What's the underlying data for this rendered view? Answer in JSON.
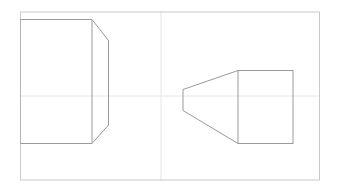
{
  "canvas": {
    "width": 341,
    "height": 193,
    "background_color": "#ffffff"
  },
  "frame": {
    "label": "drawing-frame",
    "x": 20,
    "y": 11.5,
    "width": 300,
    "height": 169,
    "stroke_color": "#c9c9c9",
    "stroke_width": 1
  },
  "guides": {
    "stroke_color": "#e8e6e4",
    "stroke_width": 1,
    "vertical": {
      "label": "vertical-center-guide",
      "x": 161,
      "y1": 11.5,
      "y2": 180.5
    },
    "horizontal": {
      "label": "horizontal-center-guide",
      "x1": 20,
      "x2": 320,
      "y": 96
    }
  },
  "shapes": {
    "stroke_color": "#9a9a9a",
    "stroke_width": 1,
    "side_view": {
      "name": "side-view-chamfered-box",
      "body_points": "20,19.5 92,19.5 92,143.5 20,143.5",
      "chamfer_points": "92,19.5 108.5,40.5 108.5,125 92,143.5",
      "edges": [
        {
          "name": "top-edge",
          "x1": 20,
          "y1": 19.5,
          "x2": 92,
          "y2": 19.5
        },
        {
          "name": "left-edge",
          "x1": 20,
          "y1": 19.5,
          "x2": 20,
          "y2": 143.5
        },
        {
          "name": "bottom-edge",
          "x1": 20,
          "y1": 143.5,
          "x2": 92,
          "y2": 143.5
        },
        {
          "name": "inner-vertical-edge",
          "x1": 92,
          "y1": 19.5,
          "x2": 92,
          "y2": 143.5
        },
        {
          "name": "top-chamfer-edge",
          "x1": 92,
          "y1": 19.5,
          "x2": 108.5,
          "y2": 40.5
        },
        {
          "name": "outer-vertical-edge",
          "x1": 108.5,
          "y1": 40.5,
          "x2": 108.5,
          "y2": 125
        },
        {
          "name": "bottom-chamfer-edge",
          "x1": 108.5,
          "y1": 125,
          "x2": 92,
          "y2": 143.5
        }
      ]
    },
    "top_view": {
      "name": "top-view-tapered-block",
      "taper_points": "183,89.5 238,70.5 238,143.5 183,110.5",
      "rect_points": "238,70.5 293,70.5 293,143.5 238,143.5",
      "edges": [
        {
          "name": "taper-nose-edge",
          "x1": 183,
          "y1": 89.5,
          "x2": 183,
          "y2": 110.5
        },
        {
          "name": "taper-top-edge",
          "x1": 183,
          "y1": 89.5,
          "x2": 238,
          "y2": 70.5
        },
        {
          "name": "taper-bottom-edge",
          "x1": 183,
          "y1": 110.5,
          "x2": 238,
          "y2": 143.5
        },
        {
          "name": "block-top-edge",
          "x1": 238,
          "y1": 70.5,
          "x2": 293,
          "y2": 70.5
        },
        {
          "name": "block-left-edge",
          "x1": 238,
          "y1": 70.5,
          "x2": 238,
          "y2": 143.5
        },
        {
          "name": "block-right-edge",
          "x1": 293,
          "y1": 70.5,
          "x2": 293,
          "y2": 143.5
        },
        {
          "name": "block-bottom-edge",
          "x1": 238,
          "y1": 143.5,
          "x2": 293,
          "y2": 143.5
        }
      ]
    }
  }
}
